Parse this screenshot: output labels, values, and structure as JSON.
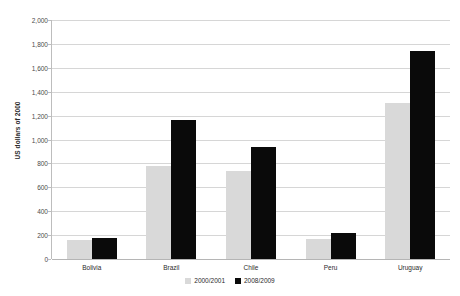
{
  "chart_data": {
    "type": "bar",
    "title": "",
    "xlabel": "",
    "ylabel": "US dollars of 2000",
    "ylim": [
      0,
      2000
    ],
    "ytick_step": 200,
    "grid": "horizontal",
    "legend_position": "bottom-center",
    "categories": [
      "Bolivia",
      "Brazil",
      "Chile",
      "Peru",
      "Uruguay"
    ],
    "ytick_labels": [
      "2,000",
      "1,800",
      "1,600",
      "1,400",
      "1,200",
      "1,000",
      "800",
      "600",
      "400",
      "200",
      "0"
    ],
    "series": [
      {
        "name": "2000/2001",
        "color": "#d9d9d9",
        "values": [
          155,
          780,
          735,
          165,
          1305
        ]
      },
      {
        "name": "2008/2009",
        "color": "#0a0a0a",
        "values": [
          180,
          1165,
          940,
          215,
          1740
        ]
      }
    ]
  }
}
